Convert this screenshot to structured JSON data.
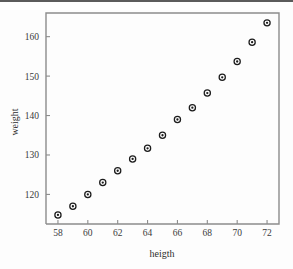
{
  "chart_data": {
    "type": "scatter",
    "title": "",
    "xlabel": "heigth",
    "ylabel": "weight",
    "xlim": [
      57.2,
      72.8
    ],
    "ylim": [
      112.5,
      166
    ],
    "grid": false,
    "legend": null,
    "xticks": [
      "58",
      "60",
      "62",
      "64",
      "66",
      "68",
      "70",
      "72"
    ],
    "yticks": [
      "120",
      "130",
      "140",
      "150",
      "160"
    ],
    "xtick_values": [
      58,
      60,
      62,
      64,
      66,
      68,
      70,
      72
    ],
    "ytick_values": [
      120,
      130,
      140,
      150,
      160
    ],
    "marker": "open-circle-with-dot",
    "series": [
      {
        "name": "weight vs heigth",
        "x": [
          58,
          59,
          60,
          61,
          62,
          63,
          64,
          65,
          66,
          67,
          68,
          69,
          70,
          71,
          72
        ],
        "y": [
          114.8,
          117.0,
          120.0,
          123.0,
          126.0,
          129.0,
          131.7,
          135.0,
          139.0,
          142.0,
          145.7,
          149.7,
          153.7,
          158.6,
          163.5
        ]
      }
    ]
  }
}
